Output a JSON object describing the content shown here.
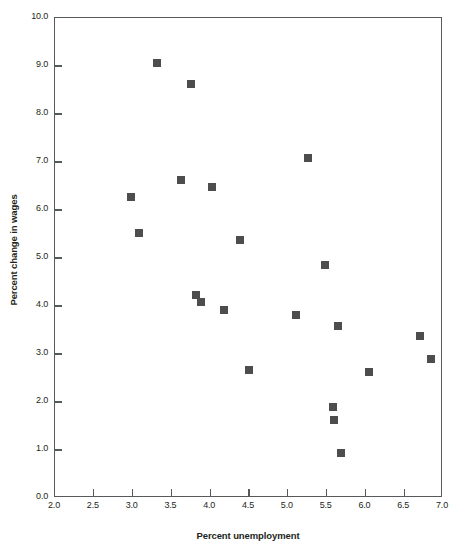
{
  "chart_data": {
    "type": "scatter",
    "title": "",
    "xlabel": "Percent unemployment",
    "ylabel": "Percent change in wages",
    "xlim": [
      2.0,
      7.0
    ],
    "ylim": [
      0.0,
      10.0
    ],
    "grid": false,
    "legend": null,
    "marker_style": "filled square",
    "marker_color": "#4d4d4d",
    "axis_color": "#58595b",
    "xticks": [
      "2.0",
      "2.5",
      "3.0",
      "3.5",
      "4.0",
      "4.5",
      "5.0",
      "5.5",
      "6.0",
      "6.5",
      "7.0"
    ],
    "xtick_values": [
      2.0,
      2.5,
      3.0,
      3.5,
      4.0,
      4.5,
      5.0,
      5.5,
      6.0,
      6.5,
      7.0
    ],
    "yticks": [
      "0.0",
      "1.0",
      "2.0",
      "3.0",
      "4.0",
      "5.0",
      "6.0",
      "7.0",
      "8.0",
      "9.0",
      "10.0"
    ],
    "ytick_values": [
      0.0,
      1.0,
      2.0,
      3.0,
      4.0,
      5.0,
      6.0,
      7.0,
      8.0,
      9.0,
      10.0
    ],
    "points": [
      {
        "x": 2.98,
        "y": 6.28
      },
      {
        "x": 3.08,
        "y": 5.52
      },
      {
        "x": 3.32,
        "y": 9.06
      },
      {
        "x": 3.62,
        "y": 6.62
      },
      {
        "x": 3.75,
        "y": 8.62
      },
      {
        "x": 3.82,
        "y": 4.22
      },
      {
        "x": 3.88,
        "y": 4.08
      },
      {
        "x": 4.02,
        "y": 6.48
      },
      {
        "x": 4.18,
        "y": 3.92
      },
      {
        "x": 4.38,
        "y": 5.38
      },
      {
        "x": 4.5,
        "y": 2.66
      },
      {
        "x": 5.1,
        "y": 3.82
      },
      {
        "x": 5.26,
        "y": 7.08
      },
      {
        "x": 5.48,
        "y": 4.86
      },
      {
        "x": 5.58,
        "y": 1.9
      },
      {
        "x": 5.6,
        "y": 1.62
      },
      {
        "x": 5.65,
        "y": 3.58
      },
      {
        "x": 5.68,
        "y": 0.94
      },
      {
        "x": 6.05,
        "y": 2.62
      },
      {
        "x": 6.7,
        "y": 3.38
      },
      {
        "x": 6.85,
        "y": 2.9
      }
    ]
  }
}
